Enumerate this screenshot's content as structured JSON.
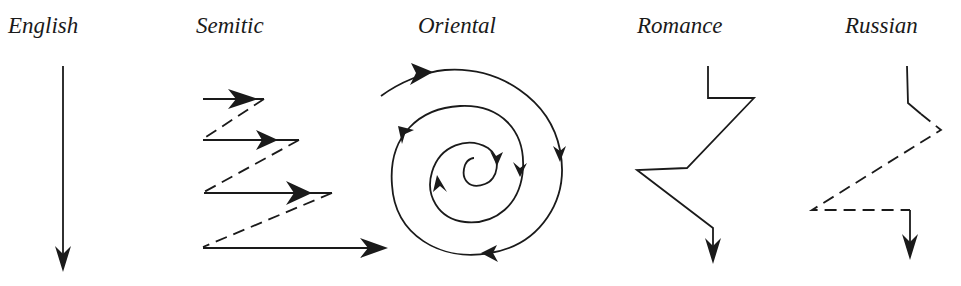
{
  "diagram": {
    "colors": {
      "background": "#ffffff",
      "ink": "#1a1a1a"
    },
    "styles": [
      {
        "id": "english",
        "label": "English",
        "pattern": "straight line downward"
      },
      {
        "id": "semitic",
        "label": "Semitic",
        "pattern": "zigzag with left-to-right arrows and dashed returns"
      },
      {
        "id": "oriental",
        "label": "Oriental",
        "pattern": "inward clockwise spiral"
      },
      {
        "id": "romance",
        "label": "Romance",
        "pattern": "angular digression path downward"
      },
      {
        "id": "russian",
        "label": "Russian",
        "pattern": "angular path with dashed digressions downward"
      }
    ]
  }
}
